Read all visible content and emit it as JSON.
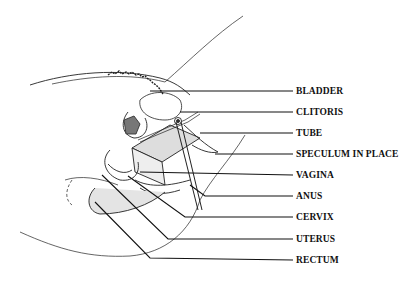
{
  "diagram": {
    "type": "anatomical-cross-section",
    "labels": [
      {
        "id": "bladder",
        "text": "BLADDER",
        "y": 89
      },
      {
        "id": "clitoris",
        "text": "CLITORIS",
        "y": 111
      },
      {
        "id": "tube",
        "text": "TUBE",
        "y": 132
      },
      {
        "id": "speculum",
        "text": "SPECULUM IN PLACE",
        "y": 152
      },
      {
        "id": "vagina",
        "text": "VAGINA",
        "y": 174
      },
      {
        "id": "anus",
        "text": "ANUS",
        "y": 196
      },
      {
        "id": "cervix",
        "text": "CERVIX",
        "y": 217
      },
      {
        "id": "uterus",
        "text": "UTERUS",
        "y": 239
      },
      {
        "id": "rectum",
        "text": "RECTUM",
        "y": 260
      }
    ]
  }
}
